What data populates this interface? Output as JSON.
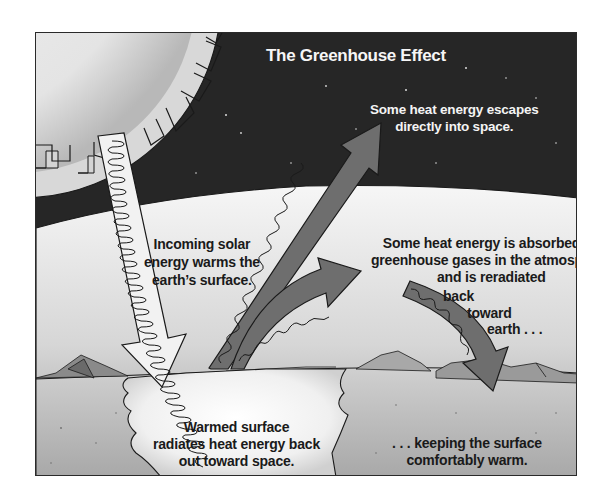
{
  "title": "The Greenhouse Effect",
  "labels": {
    "escapes": {
      "lines": [
        "Some heat energy escapes",
        "directly into space."
      ]
    },
    "incoming": {
      "lines": [
        "Incoming solar",
        "energy warms the",
        "earth’s surface."
      ]
    },
    "absorbed": {
      "lines": [
        "Some heat energy is absorbed by",
        "greenhouse gases in the atmosphere",
        "and is reradiated",
        "back",
        "toward",
        "earth . . ."
      ]
    },
    "warmed": {
      "lines": [
        "Warmed surface",
        "radiates heat energy back",
        "out toward space."
      ]
    },
    "keeping": {
      "lines": [
        ". . . keeping the surface",
        "comfortably warm."
      ]
    }
  },
  "icons": {
    "sun": "sun-icon",
    "incoming_arrow": "incoming-solar-arrow-icon",
    "escape_arrow": "escaping-heat-arrow-icon",
    "absorbed_arrow": "absorbed-heat-arrow-icon",
    "reradiated_arrow": "reradiated-heat-arrow-icon"
  },
  "colors": {
    "space": "#262626",
    "atmosphere_top": "#f4f4f4",
    "atmosphere_bottom": "#9a9a9a",
    "ground": "#b8b8b8",
    "sun": "#eeeeee",
    "heat_arrow": "#6a6a6a",
    "frame": "#2a2a2a"
  }
}
